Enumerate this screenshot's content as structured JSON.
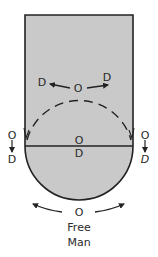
{
  "diagram": {
    "colors": {
      "court_fill": "#c9c9c9",
      "line": "#222222",
      "background": "#ffffff"
    },
    "top_group": {
      "offense": "O",
      "defender_left": "D",
      "defender_right": "D"
    },
    "center_group": {
      "offense": "O",
      "defender": "D"
    },
    "left_side": {
      "offense": "O",
      "defender": "D"
    },
    "right_side": {
      "offense": "O",
      "defender": "D"
    },
    "bottom_group": {
      "offense": "O",
      "caption_line1": "Free",
      "caption_line2": "Man"
    }
  }
}
